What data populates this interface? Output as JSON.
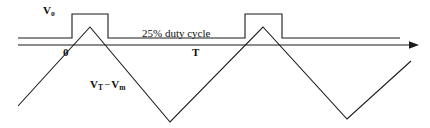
{
  "figure": {
    "background_color": "#ffffff",
    "stroke_color": "#1a1a1a",
    "width": 430,
    "height": 128
  },
  "labels": {
    "amplitude": "V",
    "amplitude_sub": "o",
    "duty_cycle": "25% duty cycle",
    "origin": "0",
    "period": "T",
    "ramp_v": "V",
    "ramp_v_sub": "T",
    "ramp_minus": "−",
    "ramp_m": "V",
    "ramp_m_sub": "m"
  },
  "chart_data": {
    "type": "line",
    "xlabel": "",
    "ylabel": "",
    "grid": false,
    "legend": "none",
    "annotations": [
      {
        "text": "V₀",
        "x": 48,
        "y": 12
      },
      {
        "text": "25% duty cycle",
        "x": 142,
        "y": 34
      },
      {
        "text": "0",
        "x": 65,
        "y": 54
      },
      {
        "text": "T",
        "x": 193,
        "y": 54
      },
      {
        "text": "Vₜ − Vₘ",
        "x": 92,
        "y": 86
      }
    ],
    "series": [
      {
        "name": "square pulse output",
        "type": "step",
        "duty_cycle_percent": 25,
        "period_px": 173,
        "low_level_px": 38,
        "high_level_px": 14,
        "points": [
          [
            18,
            38
          ],
          [
            72,
            38
          ],
          [
            72,
            14
          ],
          [
            108,
            14
          ],
          [
            108,
            38
          ],
          [
            245,
            38
          ],
          [
            245,
            14
          ],
          [
            282,
            14
          ],
          [
            282,
            38
          ],
          [
            400,
            38
          ]
        ]
      },
      {
        "name": "time axis",
        "type": "axis",
        "arrow": "right",
        "points": [
          [
            18,
            45
          ],
          [
            415,
            45
          ]
        ]
      },
      {
        "name": "triangular ramp",
        "type": "triangle",
        "points": [
          [
            18,
            106
          ],
          [
            90,
            27
          ],
          [
            170,
            122
          ],
          [
            263,
            27
          ],
          [
            347,
            119
          ],
          [
            411,
            61
          ]
        ]
      }
    ]
  }
}
